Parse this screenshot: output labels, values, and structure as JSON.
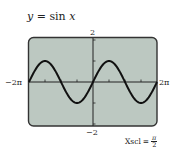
{
  "title": {
    "lhs": "y",
    "eq": " = ",
    "rhs_fn": "sin",
    "rhs_var": "x"
  },
  "window": {
    "xmin_label": "−2π",
    "xmax_label": "2π",
    "ymin_label": "−2",
    "ymax_label": "2",
    "xscl_label": "Xscl",
    "xscl_eq": "=",
    "xscl_num": "π",
    "xscl_den": "2"
  },
  "colors": {
    "screen": "#bcc8c1",
    "border": "#333333",
    "curve": "#111111",
    "axis": "#222222"
  },
  "chart_data": {
    "type": "line",
    "title": "y = sin x",
    "function": "sin(x)",
    "xlabel": "",
    "ylabel": "",
    "xlim": [
      -6.2832,
      6.2832
    ],
    "ylim": [
      -2,
      2
    ],
    "xscl": 1.5708,
    "yscl": 1,
    "x_tick_labels": [
      "−2π",
      "2π"
    ],
    "y_tick_labels": [
      "−2",
      "2"
    ],
    "annotations": [
      "Xscl = π/2"
    ],
    "grid": false,
    "series": [
      {
        "name": "y = sin x",
        "x": [
          -6.2832,
          -4.7124,
          -3.1416,
          -1.5708,
          0,
          1.5708,
          3.1416,
          4.7124,
          6.2832
        ],
        "values": [
          0,
          1,
          0,
          -1,
          0,
          1,
          0,
          -1,
          0
        ]
      }
    ]
  }
}
